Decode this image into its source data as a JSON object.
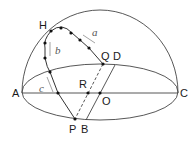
{
  "diagram": {
    "type": "hemisphere-geometry",
    "colors": {
      "line": "#333333",
      "arrow": "#999999",
      "dot": "#111111",
      "background": "#ffffff"
    },
    "points": [
      {
        "name": "A",
        "label": "A"
      },
      {
        "name": "C",
        "label": "C"
      },
      {
        "name": "H",
        "label": "H"
      },
      {
        "name": "Q",
        "label": "Q"
      },
      {
        "name": "D",
        "label": "D"
      },
      {
        "name": "R",
        "label": "R"
      },
      {
        "name": "O",
        "label": "O"
      },
      {
        "name": "P",
        "label": "P"
      },
      {
        "name": "B",
        "label": "B"
      }
    ],
    "arc_labels": {
      "a": "a",
      "b": "b",
      "c": "c"
    },
    "labels": {
      "A": "A",
      "C": "C",
      "H": "H",
      "Q": "Q",
      "D": "D",
      "R": "R",
      "O": "O",
      "P": "P",
      "B": "B"
    }
  }
}
